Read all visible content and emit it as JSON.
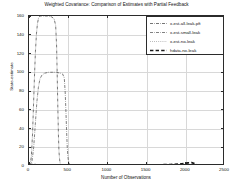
{
  "chart_data": {
    "type": "line",
    "title": "Weighted Covariance: Comparison of Estimates with Partial Feedback",
    "xlabel": "Number of Observations",
    "ylabel": "State-estimate",
    "xlim": [
      0,
      2500
    ],
    "ylim": [
      0,
      160
    ],
    "xticks": [
      0,
      500,
      1000,
      1500,
      2000,
      2500
    ],
    "yticks": [
      0,
      20,
      40,
      60,
      80,
      100,
      120,
      140,
      160
    ],
    "grid": true,
    "legend_position": "upper-right",
    "series": [
      {
        "name": "x-est-all-leak-pft",
        "style": "dash-dot",
        "color": "#3a3a3a",
        "width": 0.7,
        "points": [
          [
            0,
            0
          ],
          [
            15,
            2
          ],
          [
            30,
            10
          ],
          [
            45,
            34
          ],
          [
            58,
            66
          ],
          [
            70,
            96
          ],
          [
            82,
            122
          ],
          [
            95,
            141
          ],
          [
            108,
            152
          ],
          [
            122,
            158
          ],
          [
            140,
            160
          ],
          [
            170,
            160
          ],
          [
            210,
            160
          ],
          [
            250,
            160
          ],
          [
            290,
            159
          ],
          [
            320,
            157
          ],
          [
            340,
            150
          ],
          [
            352,
            128
          ],
          [
            360,
            96
          ],
          [
            368,
            62
          ],
          [
            375,
            34
          ],
          [
            382,
            16
          ],
          [
            390,
            7
          ],
          [
            398,
            3
          ],
          [
            410,
            1
          ],
          [
            430,
            0.5
          ],
          [
            460,
            0.4
          ],
          [
            500,
            0.4
          ],
          [
            600,
            0.4
          ],
          [
            800,
            0.4
          ],
          [
            1000,
            0.4
          ],
          [
            1200,
            0.4
          ],
          [
            1400,
            0.4
          ],
          [
            1600,
            0.4
          ],
          [
            1800,
            0.4
          ],
          [
            2000,
            0.5
          ],
          [
            2100,
            0.5
          ],
          [
            2200,
            0.4
          ],
          [
            2500,
            0.4
          ]
        ]
      },
      {
        "name": "x-est-small-leak",
        "style": "dash-dot",
        "color": "#4a4a4a",
        "width": 0.7,
        "points": [
          [
            0,
            0
          ],
          [
            20,
            1
          ],
          [
            40,
            6
          ],
          [
            60,
            20
          ],
          [
            80,
            44
          ],
          [
            100,
            68
          ],
          [
            120,
            84
          ],
          [
            140,
            93
          ],
          [
            165,
            97
          ],
          [
            200,
            99
          ],
          [
            250,
            100
          ],
          [
            300,
            100
          ],
          [
            350,
            100
          ],
          [
            400,
            99
          ],
          [
            430,
            98
          ],
          [
            450,
            94
          ],
          [
            462,
            78
          ],
          [
            472,
            56
          ],
          [
            480,
            36
          ],
          [
            488,
            20
          ],
          [
            495,
            11
          ],
          [
            502,
            6
          ],
          [
            512,
            3
          ],
          [
            525,
            1.5
          ],
          [
            545,
            0.8
          ],
          [
            580,
            0.5
          ],
          [
            700,
            0.4
          ],
          [
            1000,
            0.4
          ],
          [
            1400,
            0.4
          ],
          [
            1800,
            0.4
          ],
          [
            2000,
            0.5
          ],
          [
            2200,
            0.4
          ],
          [
            2500,
            0.4
          ]
        ]
      },
      {
        "name": "x-est-no-leak",
        "style": "dotted",
        "color": "#777777",
        "width": 0.7,
        "points": [
          [
            0,
            0
          ],
          [
            30,
            0.3
          ],
          [
            80,
            0.5
          ],
          [
            150,
            0.6
          ],
          [
            250,
            0.6
          ],
          [
            350,
            0.6
          ],
          [
            450,
            0.6
          ],
          [
            470,
            0.8
          ],
          [
            490,
            0.7
          ],
          [
            600,
            0.5
          ],
          [
            800,
            0.5
          ],
          [
            1000,
            0.5
          ],
          [
            1300,
            0.5
          ],
          [
            1600,
            0.5
          ],
          [
            1900,
            0.6
          ],
          [
            2050,
            1.2
          ],
          [
            2100,
            0.9
          ],
          [
            2200,
            0.5
          ],
          [
            2500,
            0.5
          ]
        ]
      },
      {
        "name": "hdata-no-leak",
        "style": "thick-dash",
        "color": "#1a1a1a",
        "width": 1.7,
        "points": [
          [
            0,
            1.6
          ],
          [
            40,
            1.5
          ],
          [
            90,
            1.3
          ],
          [
            150,
            1.2
          ],
          [
            220,
            1.1
          ],
          [
            300,
            1.0
          ],
          [
            380,
            1.0
          ],
          [
            460,
            1.0
          ],
          [
            560,
            1.0
          ],
          [
            700,
            1.0
          ],
          [
            850,
            1.0
          ],
          [
            1000,
            1.0
          ],
          [
            1200,
            1.0
          ],
          [
            1400,
            1.1
          ],
          [
            1600,
            1.2
          ],
          [
            1800,
            1.5
          ],
          [
            1950,
            2.4
          ],
          [
            2030,
            3.4
          ],
          [
            2075,
            3.6
          ],
          [
            2110,
            2.6
          ],
          [
            2140,
            1.4
          ],
          [
            2160,
            0.9
          ]
        ]
      }
    ]
  },
  "legend": {
    "entries": [
      {
        "label": "x-est-all-leak-pft",
        "style": "dash-dot"
      },
      {
        "label": "x-est-small-leak",
        "style": "dash-dot"
      },
      {
        "label": "x-est-no-leak",
        "style": "dotted"
      },
      {
        "label": "hdata-no-leak",
        "style": "thick-dash"
      }
    ]
  }
}
